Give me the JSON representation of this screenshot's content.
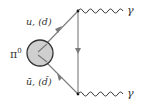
{
  "diagram": {
    "type": "feynman",
    "title": "",
    "nodes": {
      "pion": {
        "label": "π",
        "superscript": "0"
      },
      "gamma_top": {
        "label": "γ"
      },
      "gamma_bottom": {
        "label": "γ"
      }
    },
    "edges": {
      "quark": {
        "label": "u, (d)"
      },
      "antiquark": {
        "label": "ū, (d̄)"
      }
    },
    "colors": {
      "line": "#7a7a7a",
      "blob_fill": "#cfcfcf",
      "blob_stroke": "#333333",
      "photon": "#333333",
      "text": "#333333"
    }
  }
}
